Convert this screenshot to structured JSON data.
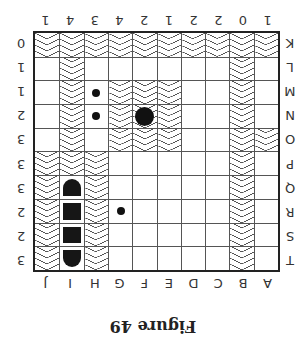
{
  "figure": {
    "caption": "Figure 49",
    "orientation": "rotated 180 degrees",
    "column_letters": [
      "A",
      "B",
      "C",
      "D",
      "E",
      "F",
      "G",
      "H",
      "I",
      "J"
    ],
    "column_counts": [
      "1",
      "0",
      "2",
      "2",
      "1",
      "2",
      "4",
      "3",
      "4",
      "1"
    ],
    "row_letters": [
      "K",
      "L",
      "M",
      "N",
      "O",
      "P",
      "Q",
      "R",
      "S",
      "T"
    ],
    "row_counts": [
      "0",
      "1",
      "1",
      "2",
      "3",
      "3",
      "3",
      "2",
      "2",
      "3"
    ],
    "colors": {
      "ink": "#222222",
      "hatch": "#555555",
      "background": "#ffffff"
    },
    "grid": {
      "columns": 10,
      "rows": 10,
      "cells": [
        {
          "row": "K",
          "hatched": [
            "A",
            "B",
            "C",
            "D",
            "E",
            "F",
            "G",
            "H",
            "I",
            "J"
          ]
        },
        {
          "row": "L",
          "hatched": [
            "B",
            "I"
          ]
        },
        {
          "row": "M",
          "hatched": [
            "B",
            "E",
            "F",
            "G",
            "I"
          ]
        },
        {
          "row": "N",
          "hatched": [
            "B",
            "E",
            "F",
            "G",
            "I"
          ]
        },
        {
          "row": "O",
          "hatched": [
            "A",
            "B",
            "E",
            "F",
            "G",
            "I"
          ]
        },
        {
          "row": "P",
          "hatched": [
            "B",
            "H",
            "I",
            "J"
          ]
        },
        {
          "row": "Q",
          "hatched": [
            "B",
            "H",
            "J"
          ]
        },
        {
          "row": "R",
          "hatched": [
            "B",
            "H",
            "J"
          ]
        },
        {
          "row": "S",
          "hatched": [
            "B",
            "H",
            "J"
          ]
        },
        {
          "row": "T",
          "hatched": [
            "B",
            "H",
            "J"
          ]
        }
      ],
      "markers": [
        {
          "type": "small-dot",
          "row": "R",
          "col": "G"
        },
        {
          "type": "small-dot",
          "row": "M",
          "col": "H"
        },
        {
          "type": "small-dot",
          "row": "N",
          "col": "H"
        },
        {
          "type": "large-dot",
          "row": "N",
          "col": "F"
        },
        {
          "type": "vertical-ship",
          "col": "I",
          "rows": [
            "Q",
            "R",
            "S",
            "T"
          ]
        }
      ]
    }
  }
}
